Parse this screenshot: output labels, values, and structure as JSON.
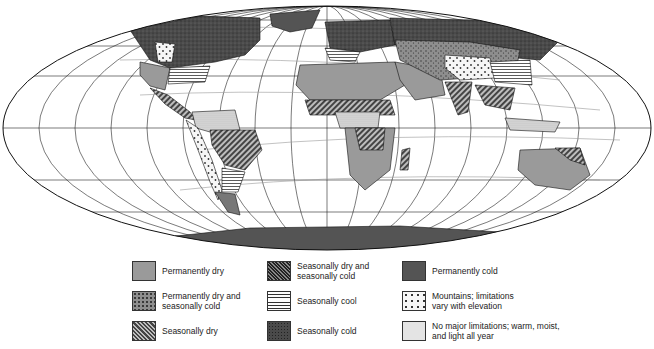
{
  "map": {
    "projection": "world-ellipse",
    "regions": [
      {
        "name": "north-america",
        "category": "seasonally_cold"
      },
      {
        "name": "greenland",
        "category": "permanently_cold"
      },
      {
        "name": "north-america-west-mountains",
        "category": "mountains"
      },
      {
        "name": "north-america-southwest",
        "category": "permanently_dry"
      },
      {
        "name": "north-america-southeast",
        "category": "seasonally_cool"
      },
      {
        "name": "central-america",
        "category": "seasonally_dry"
      },
      {
        "name": "south-america-amazon",
        "category": "no_major_limitations"
      },
      {
        "name": "south-america-brazil",
        "category": "seasonally_dry"
      },
      {
        "name": "south-america-andes",
        "category": "mountains"
      },
      {
        "name": "south-america-south",
        "category": "seasonally_cool"
      },
      {
        "name": "africa-sahara",
        "category": "permanently_dry"
      },
      {
        "name": "africa-sahel",
        "category": "seasonally_dry"
      },
      {
        "name": "africa-central",
        "category": "no_major_limitations"
      },
      {
        "name": "africa-south",
        "category": "permanently_dry"
      },
      {
        "name": "madagascar",
        "category": "seasonally_dry"
      },
      {
        "name": "europe",
        "category": "seasonally_cold"
      },
      {
        "name": "europe-south",
        "category": "seasonally_cool"
      },
      {
        "name": "middle-east",
        "category": "permanently_dry"
      },
      {
        "name": "central-asia",
        "category": "permanently_dry_and_seasonally_cold"
      },
      {
        "name": "siberia",
        "category": "seasonally_cold"
      },
      {
        "name": "tibet",
        "category": "mountains"
      },
      {
        "name": "east-asia",
        "category": "seasonally_cool"
      },
      {
        "name": "india",
        "category": "seasonally_dry"
      },
      {
        "name": "southeast-asia",
        "category": "seasonally_dry"
      },
      {
        "name": "indonesia",
        "category": "no_major_limitations"
      },
      {
        "name": "australia",
        "category": "permanently_dry"
      },
      {
        "name": "australia-north",
        "category": "seasonally_dry"
      },
      {
        "name": "new-zealand",
        "category": "seasonally_cool"
      },
      {
        "name": "antarctica",
        "category": "permanently_cold"
      }
    ]
  },
  "legend": {
    "items": [
      {
        "key": "permanently_dry",
        "label": "Permanently dry",
        "pattern": "solid-light-gray",
        "color": "#9a9a9a"
      },
      {
        "key": "permanently_dry_and_seasonally_cold",
        "label": "Permanently dry and\nseasonally cold",
        "pattern": "speckled-gray",
        "color": "#8a8a8a"
      },
      {
        "key": "seasonally_dry",
        "label": "Seasonally dry",
        "pattern": "diagonal-hatch",
        "color": "#7a7a7a"
      },
      {
        "key": "seasonally_dry_and_seasonally_cold",
        "label": "Seasonally dry and\nseasonally cold",
        "pattern": "dense-diagonal-dark",
        "color": "#3e3e3e"
      },
      {
        "key": "seasonally_cool",
        "label": "Seasonally cool",
        "pattern": "horizontal-lines",
        "color": "#ffffff"
      },
      {
        "key": "seasonally_cold",
        "label": "Seasonally cold",
        "pattern": "dark-speckled",
        "color": "#4a4a4a"
      },
      {
        "key": "permanently_cold",
        "label": "Permanently cold",
        "pattern": "solid-dark-gray",
        "color": "#545454"
      },
      {
        "key": "mountains",
        "label": "Mountains; limitations\nvary with elevation",
        "pattern": "sparse-dots",
        "color": "#f4f4f4"
      },
      {
        "key": "no_major_limitations",
        "label": "No major limitations; warm, moist,\nand light all year",
        "pattern": "fine-dots",
        "color": "#d6d6d6"
      }
    ]
  }
}
